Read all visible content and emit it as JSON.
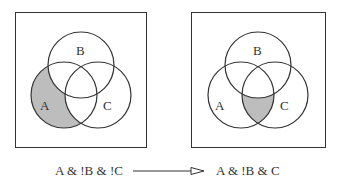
{
  "diagrams": [
    {
      "name": "before",
      "labels": {
        "a": "A",
        "b": "B",
        "c": "C"
      },
      "shaded_region": "A & !B & !C",
      "expression": "A & !B & !C"
    },
    {
      "name": "after",
      "labels": {
        "a": "A",
        "b": "B",
        "c": "C"
      },
      "shaded_region": "A & !B & C",
      "expression": "A & !B & C"
    }
  ],
  "colors": {
    "stroke": "#333333",
    "shade": "#bdbdbd",
    "background": "#ffffff"
  },
  "arrow": {
    "type": "open-triangle"
  }
}
